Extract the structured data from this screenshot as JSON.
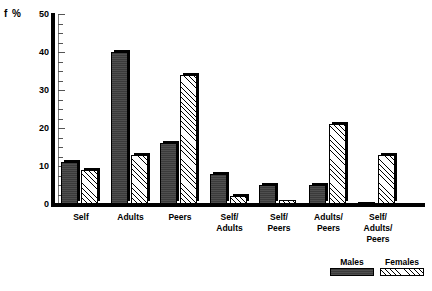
{
  "chart_data": {
    "type": "bar",
    "title": "",
    "xlabel": "",
    "ylabel": "f %",
    "ylim": [
      0,
      50
    ],
    "ytick_labels": [
      "0",
      "10",
      "20",
      "30",
      "40",
      "50"
    ],
    "ytick_values": [
      0,
      10,
      20,
      30,
      40,
      50
    ],
    "yminor_step": 2.5,
    "grid": false,
    "legend_position": "bottom-right",
    "categories": [
      "Self",
      "Adults",
      "Peers",
      "Self/\nAdults",
      "Self/\nPeers",
      "Adults/\nPeers",
      "Self/\nAdults/\nPeers"
    ],
    "series": [
      {
        "name": "Males",
        "values": [
          11,
          40,
          16,
          8,
          5,
          5,
          0.5
        ]
      },
      {
        "name": "Females",
        "values": [
          9,
          13,
          34,
          2,
          1,
          21,
          13
        ]
      }
    ]
  },
  "legend": {
    "items": [
      {
        "label": "Males",
        "swatch": "solid-dark-fill"
      },
      {
        "label": "Females",
        "swatch": "diagonal-hatch-fill"
      }
    ]
  }
}
